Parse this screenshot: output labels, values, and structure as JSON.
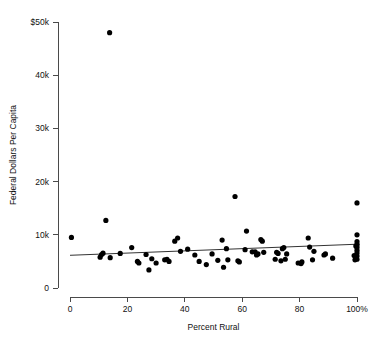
{
  "chart_data": {
    "type": "scatter",
    "title": "",
    "xlabel": "Percent Rural",
    "ylabel": "Federal Dollars Per Capita",
    "xlim": [
      0,
      100
    ],
    "ylim": [
      0,
      50000
    ],
    "grid": false,
    "legend": null,
    "x_ticks": [
      0,
      20,
      40,
      60,
      80,
      100
    ],
    "x_tick_labels": [
      "0",
      "20",
      "40",
      "60",
      "80",
      "100%"
    ],
    "y_ticks": [
      0,
      10000,
      20000,
      30000,
      40000,
      50000
    ],
    "y_tick_labels": [
      "0",
      "10k",
      "20k",
      "30k",
      "40k",
      "$50k"
    ],
    "marker": {
      "shape": "circle",
      "color": "#000000",
      "size": 2.6
    },
    "trendline": {
      "type": "linear",
      "color": "#333333",
      "x_start": 0,
      "y_start": 6150,
      "x_end": 101,
      "y_end": 8250
    },
    "points": [
      {
        "x": 0.5,
        "y": 9500
      },
      {
        "x": 10.5,
        "y": 5800
      },
      {
        "x": 11.0,
        "y": 6300
      },
      {
        "x": 11.5,
        "y": 6550
      },
      {
        "x": 12.5,
        "y": 12700
      },
      {
        "x": 13.8,
        "y": 48000
      },
      {
        "x": 14.0,
        "y": 5700
      },
      {
        "x": 17.5,
        "y": 6500
      },
      {
        "x": 21.5,
        "y": 7600
      },
      {
        "x": 23.5,
        "y": 5000
      },
      {
        "x": 24.0,
        "y": 4700
      },
      {
        "x": 26.5,
        "y": 6300
      },
      {
        "x": 27.5,
        "y": 3400
      },
      {
        "x": 28.5,
        "y": 5500
      },
      {
        "x": 30.0,
        "y": 4700
      },
      {
        "x": 33.0,
        "y": 5300
      },
      {
        "x": 33.8,
        "y": 5400
      },
      {
        "x": 34.5,
        "y": 5000
      },
      {
        "x": 36.5,
        "y": 8800
      },
      {
        "x": 37.5,
        "y": 9400
      },
      {
        "x": 38.5,
        "y": 6900
      },
      {
        "x": 41.0,
        "y": 7300
      },
      {
        "x": 43.5,
        "y": 6200
      },
      {
        "x": 45.0,
        "y": 5000
      },
      {
        "x": 47.5,
        "y": 4400
      },
      {
        "x": 49.5,
        "y": 6400
      },
      {
        "x": 51.5,
        "y": 5200
      },
      {
        "x": 53.0,
        "y": 9000
      },
      {
        "x": 53.5,
        "y": 3900
      },
      {
        "x": 54.5,
        "y": 7400
      },
      {
        "x": 55.0,
        "y": 5300
      },
      {
        "x": 57.5,
        "y": 17200
      },
      {
        "x": 58.5,
        "y": 5100
      },
      {
        "x": 59.0,
        "y": 4900
      },
      {
        "x": 61.0,
        "y": 7200
      },
      {
        "x": 61.5,
        "y": 10700
      },
      {
        "x": 63.5,
        "y": 6800
      },
      {
        "x": 64.5,
        "y": 6800
      },
      {
        "x": 65.0,
        "y": 6200
      },
      {
        "x": 65.5,
        "y": 6400
      },
      {
        "x": 66.5,
        "y": 9100
      },
      {
        "x": 67.0,
        "y": 8800
      },
      {
        "x": 67.5,
        "y": 6700
      },
      {
        "x": 71.5,
        "y": 5400
      },
      {
        "x": 72.0,
        "y": 6700
      },
      {
        "x": 72.5,
        "y": 6500
      },
      {
        "x": 73.5,
        "y": 5100
      },
      {
        "x": 74.0,
        "y": 7400
      },
      {
        "x": 74.5,
        "y": 7600
      },
      {
        "x": 75.0,
        "y": 5400
      },
      {
        "x": 75.5,
        "y": 6400
      },
      {
        "x": 79.5,
        "y": 4700
      },
      {
        "x": 80.5,
        "y": 4600
      },
      {
        "x": 80.8,
        "y": 4900
      },
      {
        "x": 83.0,
        "y": 9400
      },
      {
        "x": 83.5,
        "y": 7700
      },
      {
        "x": 84.5,
        "y": 5300
      },
      {
        "x": 85.0,
        "y": 6900
      },
      {
        "x": 88.5,
        "y": 6200
      },
      {
        "x": 89.0,
        "y": 6400
      },
      {
        "x": 91.5,
        "y": 5600
      },
      {
        "x": 99.0,
        "y": 6100
      },
      {
        "x": 99.3,
        "y": 5300
      },
      {
        "x": 99.6,
        "y": 7900
      },
      {
        "x": 100.0,
        "y": 16000
      },
      {
        "x": 100.0,
        "y": 10000
      },
      {
        "x": 100.0,
        "y": 8700
      },
      {
        "x": 100.0,
        "y": 8100
      },
      {
        "x": 100.0,
        "y": 7600
      },
      {
        "x": 100.0,
        "y": 7100
      },
      {
        "x": 100.0,
        "y": 6600
      },
      {
        "x": 100.0,
        "y": 6000
      },
      {
        "x": 100.0,
        "y": 5400
      }
    ]
  }
}
